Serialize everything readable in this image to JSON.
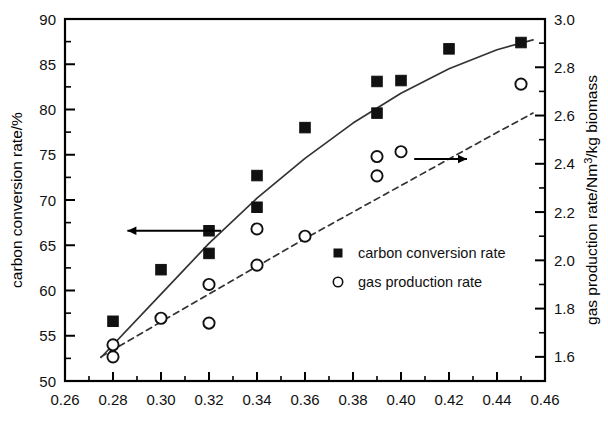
{
  "chart_data": {
    "type": "scatter",
    "title": "",
    "subtitle": "",
    "xlabel": "",
    "ylabel": "carbon conversion rate/%",
    "y2label": "gas production rate/Nm3/kg biomass",
    "y2label_display": "gas production rate/Nm",
    "y2label_sup": "3",
    "y2label_tail": "/kg biomass",
    "xlim": [
      0.26,
      0.46
    ],
    "ylim": [
      50,
      90
    ],
    "y2lim": [
      1.5,
      3.0
    ],
    "xticks": [
      0.26,
      0.28,
      0.3,
      0.32,
      0.34,
      0.36,
      0.38,
      0.4,
      0.42,
      0.44,
      0.46
    ],
    "xticklabels": [
      "0.26",
      "0.28",
      "0.30",
      "0.32",
      "0.34",
      "0.36",
      "0.38",
      "0.40",
      "0.42",
      "0.44",
      "0.46"
    ],
    "xminor_step": 0.01,
    "yticks": [
      50,
      55,
      60,
      65,
      70,
      75,
      80,
      85,
      90
    ],
    "yticklabels": [
      "50",
      "55",
      "60",
      "65",
      "70",
      "75",
      "80",
      "85",
      "90"
    ],
    "yminor_step": 2.5,
    "y2ticks": [
      1.6,
      1.8,
      2.0,
      2.2,
      2.4,
      2.6,
      2.8,
      3.0
    ],
    "y2ticklabels": [
      "1.6",
      "1.8",
      "2.0",
      "2.2",
      "2.4",
      "2.6",
      "2.8",
      "3.0"
    ],
    "y2minor_step": 0.1,
    "grid": false,
    "legend_position": "center-right",
    "series": [
      {
        "name": "carbon conversion rate",
        "marker": "filled-square",
        "axis": "left",
        "line": "solid",
        "x": [
          0.28,
          0.3,
          0.32,
          0.32,
          0.34,
          0.34,
          0.36,
          0.39,
          0.39,
          0.4,
          0.42,
          0.45
        ],
        "y": [
          56.6,
          62.3,
          64.1,
          66.6,
          69.2,
          72.7,
          78.0,
          79.6,
          83.1,
          83.2,
          86.7,
          87.4
        ]
      },
      {
        "name": "gas production rate",
        "marker": "open-circle",
        "axis": "right",
        "line": "dashed",
        "x": [
          0.28,
          0.28,
          0.3,
          0.32,
          0.32,
          0.34,
          0.34,
          0.36,
          0.39,
          0.39,
          0.4,
          0.45
        ],
        "y": [
          1.6,
          1.65,
          1.76,
          1.74,
          1.9,
          1.98,
          2.13,
          2.1,
          2.35,
          2.43,
          2.45,
          2.73
        ]
      }
    ],
    "fit_curves": [
      {
        "name": "carbon conversion rate fit",
        "style": "solid",
        "axis": "left",
        "x": [
          0.275,
          0.3,
          0.32,
          0.34,
          0.36,
          0.38,
          0.4,
          0.42,
          0.44,
          0.455
        ],
        "y": [
          52.6,
          59.6,
          65.2,
          70.2,
          74.6,
          78.5,
          81.8,
          84.5,
          86.6,
          87.7
        ]
      },
      {
        "name": "gas production rate fit",
        "style": "dashed",
        "axis": "right",
        "x": [
          0.275,
          0.3,
          0.32,
          0.34,
          0.36,
          0.38,
          0.4,
          0.42,
          0.44,
          0.455
        ],
        "y": [
          1.6,
          1.745,
          1.86,
          1.975,
          2.09,
          2.2,
          2.31,
          2.42,
          2.53,
          2.61
        ]
      }
    ],
    "annotations": [
      {
        "name": "left-axis-arrow",
        "type": "arrow",
        "direction": "left",
        "points_to": "carbon conversion rate/%",
        "x_from": 0.325,
        "x_to": 0.286,
        "y": 66.6
      },
      {
        "name": "right-axis-arrow",
        "type": "arrow",
        "direction": "right",
        "points_to": "gas production rate/Nm3/kg biomass",
        "x_from": 0.4055,
        "x_to": 0.4275,
        "y2": 2.42
      }
    ],
    "legend": [
      {
        "marker": "filled-square",
        "label": "carbon conversion rate"
      },
      {
        "marker": "open-circle",
        "label": "gas production rate"
      }
    ]
  },
  "colors": {
    "axis": "#000000",
    "marker_filled": "#111111",
    "marker_open_stroke": "#111111",
    "line": "#333333",
    "background": "#ffffff"
  }
}
